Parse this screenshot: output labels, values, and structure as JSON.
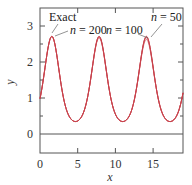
{
  "chart_data": {
    "type": "line",
    "title": "",
    "xlabel": "x",
    "ylabel": "y",
    "xlim": [
      0,
      19
    ],
    "ylim": [
      -0.5,
      3.5
    ],
    "x_ticks": [
      0,
      5,
      10,
      15
    ],
    "x_tick_labels": [
      "0",
      "5",
      "10",
      "15"
    ],
    "y_ticks": [
      0,
      1,
      2,
      3
    ],
    "y_tick_labels": [
      "0",
      "1",
      "2",
      "3"
    ],
    "grid": false,
    "legend": null,
    "function_hint": "y = exp(sin x)",
    "series": [
      {
        "name": "Exact",
        "color": "#c8404a",
        "x": [
          0,
          1.57,
          4.71,
          7.85,
          10.99,
          14.14,
          17.28,
          19
        ],
        "values": [
          1.0,
          2.72,
          0.37,
          2.72,
          0.37,
          2.72,
          0.37,
          1.16
        ]
      },
      {
        "name": "n = 200",
        "color": "#c8404a",
        "x": [
          0,
          1.57,
          4.71,
          7.85,
          10.99,
          14.14,
          17.28,
          19
        ],
        "values": [
          1.0,
          2.71,
          0.37,
          2.71,
          0.37,
          2.71,
          0.37,
          1.16
        ]
      },
      {
        "name": "n = 100",
        "color": "#c8404a",
        "x": [
          0,
          1.57,
          4.71,
          7.85,
          10.99,
          14.14,
          17.28,
          19
        ],
        "values": [
          1.0,
          2.7,
          0.37,
          2.7,
          0.37,
          2.69,
          0.37,
          1.15
        ]
      },
      {
        "name": "n = 50",
        "color": "#c8404a",
        "x": [
          0,
          1.57,
          4.71,
          7.85,
          10.99,
          14.14,
          17.28,
          19
        ],
        "values": [
          1.0,
          2.68,
          0.37,
          2.66,
          0.37,
          2.63,
          0.38,
          1.14
        ]
      }
    ],
    "annotations": [
      {
        "text": "Exact",
        "x": 1.6,
        "y": 2.72
      },
      {
        "text": "n = 200",
        "x": 1.6,
        "y": 2.71
      },
      {
        "text": "n = 100",
        "x": 14.1,
        "y": 2.69
      },
      {
        "text": "n = 50",
        "x": 14.1,
        "y": 2.63
      }
    ]
  },
  "labels": {
    "xlabel": "x",
    "ylabel": "y",
    "x0": "0",
    "x5": "5",
    "x10": "10",
    "x15": "15",
    "y0": "0",
    "y1": "1",
    "y2": "2",
    "y3": "3",
    "anno_exact": "Exact",
    "anno_n200_var": "n",
    "anno_n200_rest": " = 200",
    "anno_n100_var": "n",
    "anno_n100_rest": " = 100",
    "anno_n50_var": "n",
    "anno_n50_rest": " = 50"
  },
  "colors": {
    "curve": "#c8404a",
    "axis": "#555555"
  }
}
